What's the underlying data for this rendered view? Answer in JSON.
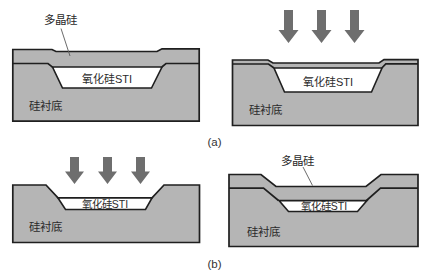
{
  "figure": {
    "captions": {
      "a": "(a)",
      "b": "(b)"
    },
    "colors": {
      "material": "#b5b5b5",
      "arrow": "#6e6e6e",
      "outline": "#1f1f1f",
      "oxide": "#ffffff",
      "background": "#ffffff",
      "text": "#2b2b2b"
    },
    "panels": {
      "a1": {
        "annotation": "多晶硅",
        "oxide": "氧化硅STI",
        "substrate": "硅衬底"
      },
      "a2": {
        "oxide": "氧化硅STI",
        "substrate": "硅衬底"
      },
      "b1": {
        "oxide": "氧化硅STI",
        "substrate": "硅衬底"
      },
      "b2": {
        "annotation": "多晶硅",
        "oxide": "氧化硅STI",
        "substrate": "硅衬底"
      }
    }
  }
}
